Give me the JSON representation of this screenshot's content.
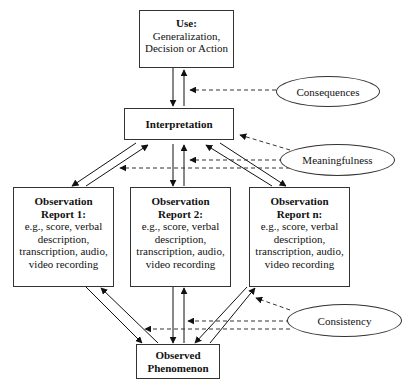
{
  "nodes": {
    "use": {
      "title": "Use:",
      "line1": "Generalization,",
      "line2": "Decision or Action"
    },
    "interpretation": {
      "title": "Interpretation"
    },
    "report1": {
      "title1": "Observation",
      "title2": "Report 1:",
      "l1": "e.g., score, verbal",
      "l2": "description,",
      "l3": "transcription, audio,",
      "l4": "video recording"
    },
    "report2": {
      "title1": "Observation",
      "title2": "Report 2:",
      "l1": "e.g., score, verbal",
      "l2": "description,",
      "l3": "transcription, audio,",
      "l4": "video recording"
    },
    "reportn": {
      "title1": "Observation",
      "title2": "Report n:",
      "l1": "e.g., score, verbal",
      "l2": "description,",
      "l3": "transcription, audio,",
      "l4": "video recording"
    },
    "phenomenon": {
      "title1": "Observed",
      "title2": "Phenomenon"
    }
  },
  "criteria": {
    "consequences": "Consequences",
    "meaningfulness": "Meaningfulness",
    "consistency": "Consistency"
  }
}
